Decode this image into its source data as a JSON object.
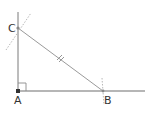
{
  "diagram": {
    "type": "geometric-construction",
    "points": {
      "A": {
        "label": "A",
        "x": 18,
        "y": 91
      },
      "B": {
        "label": "B",
        "x": 103,
        "y": 91
      },
      "C": {
        "label": "C",
        "x": 18,
        "y": 28
      }
    },
    "labels": {
      "A": "A",
      "B": "B",
      "C": "C"
    },
    "colors": {
      "axis_line": "#6e6e6e",
      "hypotenuse": "#9a9a9a",
      "arc": "#b8b8b8",
      "point": "#444444",
      "label": "#333333"
    },
    "marks": {
      "right_angle_at": "A",
      "equal_tick_segment": "CB",
      "construction_arcs_at": [
        "B",
        "C"
      ]
    }
  }
}
